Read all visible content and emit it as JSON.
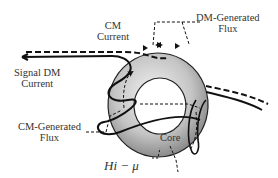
{
  "labels": {
    "cm_current": [
      "CM",
      "Current"
    ],
    "dm_flux": [
      "DM-Generated",
      "Flux"
    ],
    "signal_dm": [
      "Signal DM",
      "Current"
    ],
    "cm_flux": [
      "CM-Generated",
      "Flux"
    ],
    "core": "Core",
    "material": "Hi − μ"
  },
  "colors": {
    "line": "#111111",
    "core_light": "#e6e6e6",
    "core_dark": "#8a8a8a",
    "text": "#333333"
  }
}
